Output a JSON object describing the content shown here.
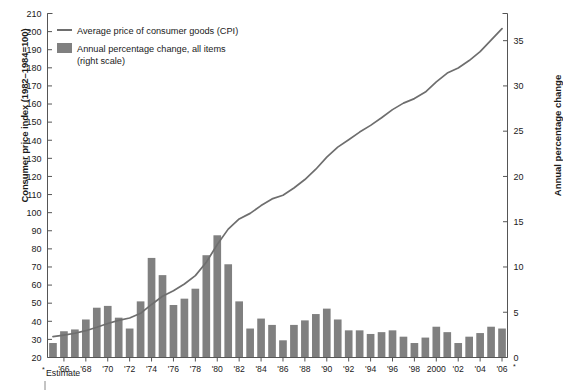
{
  "chart_data": {
    "type": "bar",
    "title": "",
    "xlabel": "",
    "ylabel": "Consumer price index (1982–1984=100)",
    "y2label": "Annual percentage change",
    "grid": false,
    "legend_position": "top-left",
    "ylim": [
      20,
      210
    ],
    "y2lim": [
      0,
      38
    ],
    "xlim": [
      1964.5,
      2006.5
    ],
    "yticks": [
      20,
      30,
      40,
      50,
      60,
      70,
      80,
      90,
      100,
      110,
      120,
      130,
      140,
      150,
      160,
      170,
      180,
      190,
      200,
      210
    ],
    "ytick_labels": [
      "20",
      "30",
      "40",
      "50",
      "60",
      "70",
      "80",
      "90",
      "100",
      "110",
      "120",
      "130",
      "140",
      "150",
      "160",
      "170",
      "180",
      "190",
      "200",
      "210"
    ],
    "y2ticks": [
      0,
      5,
      10,
      15,
      20,
      25,
      30,
      35
    ],
    "y2tick_labels": [
      "0",
      "5",
      "10",
      "15",
      "20",
      "25",
      "30",
      "35"
    ],
    "x": [
      1965,
      1966,
      1967,
      1968,
      1969,
      1970,
      1971,
      1972,
      1973,
      1974,
      1975,
      1976,
      1977,
      1978,
      1979,
      1980,
      1981,
      1982,
      1983,
      1984,
      1985,
      1986,
      1987,
      1988,
      1989,
      1990,
      1991,
      1992,
      1993,
      1994,
      1995,
      1996,
      1997,
      1998,
      1999,
      2000,
      2001,
      2002,
      2003,
      2004,
      2005,
      2006
    ],
    "xtick_values": [
      1966,
      1968,
      1970,
      1972,
      1974,
      1976,
      1978,
      1980,
      1982,
      1984,
      1986,
      1988,
      1990,
      1992,
      1994,
      1996,
      1998,
      2000,
      2002,
      2004,
      2006
    ],
    "xtick_labels": [
      "'66",
      "'68",
      "'70",
      "'72",
      "'74",
      "'76",
      "'78",
      "'80",
      "'82",
      "'84",
      "'86",
      "'88",
      "'90",
      "'92",
      "'94",
      "'96",
      "'98",
      "2000",
      "'02",
      "'04",
      "'06"
    ],
    "series": [
      {
        "name": "Annual percentage change, all items (right scale)",
        "kind": "bar",
        "axis": "right",
        "color": "#808080",
        "values": [
          1.6,
          2.9,
          3.1,
          4.2,
          5.5,
          5.7,
          4.4,
          3.2,
          6.2,
          11.0,
          9.1,
          5.8,
          6.5,
          7.6,
          11.3,
          13.5,
          10.3,
          6.2,
          3.2,
          4.3,
          3.6,
          1.9,
          3.6,
          4.1,
          4.8,
          5.4,
          4.2,
          3.0,
          3.0,
          2.6,
          2.8,
          3.0,
          2.3,
          1.6,
          2.2,
          3.4,
          2.8,
          1.6,
          2.3,
          2.7,
          3.4,
          3.2
        ]
      },
      {
        "name": "Average price of consumer goods (CPI)",
        "kind": "line",
        "axis": "left",
        "color": "#6e6e6e",
        "values": [
          31.5,
          32.4,
          33.4,
          34.8,
          36.7,
          38.8,
          40.5,
          41.8,
          44.4,
          49.3,
          53.8,
          56.9,
          60.6,
          65.2,
          72.6,
          82.4,
          90.9,
          96.5,
          99.6,
          103.9,
          107.6,
          109.6,
          113.6,
          118.3,
          124.0,
          130.7,
          136.2,
          140.3,
          144.5,
          148.2,
          152.4,
          156.9,
          160.5,
          163.0,
          166.6,
          172.2,
          177.1,
          179.9,
          184.0,
          188.9,
          195.3,
          201.6
        ]
      }
    ]
  },
  "legend": {
    "items": [
      {
        "marker": "line",
        "label": "Average price of consumer goods (CPI)"
      },
      {
        "marker": "swatch",
        "label": "Annual percentage change, all items"
      },
      {
        "marker": "none",
        "label": "(right scale)"
      }
    ]
  },
  "footnote": {
    "star": "*",
    "text": "Estimate"
  },
  "colors": {
    "bar": "#808080",
    "line": "#6e6e6e",
    "axis": "#555555",
    "text": "#1a1a1a"
  }
}
